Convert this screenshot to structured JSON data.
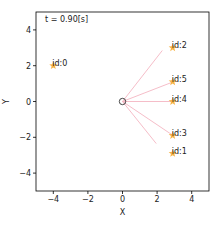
{
  "chart_data": {
    "type": "scatter",
    "title": "",
    "annotation": "t = 0.90[s]",
    "xlabel": "X",
    "ylabel": "Y",
    "xlim": [
      -5,
      5
    ],
    "ylim": [
      -5,
      5
    ],
    "xticks": [
      -4,
      -2,
      0,
      2,
      4
    ],
    "yticks": [
      -4,
      -2,
      0,
      2,
      4
    ],
    "xtick_labels": [
      "−4",
      "−2",
      "0",
      "2",
      "4"
    ],
    "ytick_labels": [
      "−4",
      "−2",
      "0",
      "2",
      "4"
    ],
    "grid": false,
    "legend": null,
    "agent": {
      "x": 0,
      "y": 0,
      "marker": "circle",
      "color": "#333333"
    },
    "targets": [
      {
        "label": "id:0",
        "x": -4.0,
        "y": 2.0
      },
      {
        "label": "id:1",
        "x": 2.9,
        "y": -2.9
      },
      {
        "label": "id:2",
        "x": 2.9,
        "y": 3.0
      },
      {
        "label": "id:3",
        "x": 2.9,
        "y": -1.9
      },
      {
        "label": "id:4",
        "x": 2.9,
        "y": 0.0
      },
      {
        "label": "id:5",
        "x": 2.9,
        "y": 1.1
      }
    ],
    "rays": [
      {
        "to": "id:2",
        "x2": 2.3,
        "y2": 2.85
      },
      {
        "to": "id:5",
        "x2": 2.8,
        "y2": 1.05
      },
      {
        "to": "id:4",
        "x2": 2.8,
        "y2": 0.0
      },
      {
        "to": "id:3",
        "x2": 2.85,
        "y2": -1.85
      },
      {
        "to": "id:1",
        "x2": 1.95,
        "y2": -2.35
      }
    ],
    "colors": {
      "target_star": "#f5a623",
      "ray": "#f4b6c2",
      "agent": "#333333",
      "axes": "#000000"
    }
  }
}
